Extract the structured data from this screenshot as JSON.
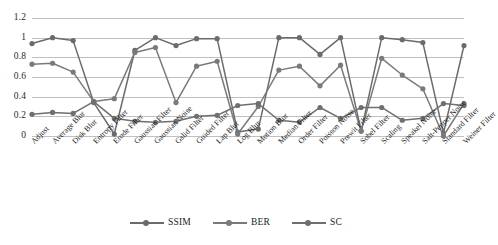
{
  "chart_data": {
    "type": "line",
    "title": "",
    "subtitle": "",
    "xlabel": "",
    "ylabel": "",
    "ylim": [
      0,
      1.2
    ],
    "yticks": [
      "0",
      "0.2",
      "0.4",
      "0.6",
      "0.8",
      "1",
      "1.2"
    ],
    "ytick_values": [
      0,
      0.2,
      0.4,
      0.6,
      0.8,
      1,
      1.2
    ],
    "grid": true,
    "legend_position": "bottom",
    "categories": [
      "Adjust",
      "Average Blur",
      "Disk Blur",
      "Entropy Filter",
      "Erode Filter",
      "Gaussian Filter",
      "Gaussian Noise",
      "Gslid Filter",
      "Guided Filter",
      "Lap Blur",
      "Log Blur",
      "Motion Blur",
      "Median Filter",
      "Order Filter",
      "Poisson Noise",
      "Prewit Filter",
      "Sobel Filter",
      "Scaling",
      "Speakel Noise",
      "Salt-Pepper Noise",
      "Standard Filter",
      "Weiner Filter"
    ],
    "series": [
      {
        "name": "SSIM",
        "color": "#6b6b6b",
        "values": [
          0.94,
          1.0,
          0.97,
          0.34,
          0.02,
          0.87,
          1.0,
          0.92,
          0.99,
          0.99,
          0.04,
          0.07,
          1.0,
          1.0,
          0.83,
          1.0,
          0.05,
          1.0,
          0.98,
          0.95,
          0.03,
          0.92
        ]
      },
      {
        "name": "BER",
        "color": "#7a7a7a",
        "values": [
          0.73,
          0.74,
          0.65,
          0.35,
          0.38,
          0.85,
          0.9,
          0.34,
          0.71,
          0.76,
          0.02,
          0.3,
          0.67,
          0.71,
          0.51,
          0.72,
          0.05,
          0.79,
          0.62,
          0.48,
          0.0,
          0.33
        ]
      },
      {
        "name": "SC",
        "color": "#6f6f6f",
        "values": [
          0.22,
          0.24,
          0.23,
          0.35,
          0.18,
          0.15,
          0.14,
          0.15,
          0.2,
          0.21,
          0.31,
          0.33,
          0.16,
          0.14,
          0.29,
          0.18,
          0.29,
          0.29,
          0.16,
          0.18,
          0.33,
          0.31
        ]
      }
    ]
  },
  "legend": {
    "entries": [
      {
        "label": "SSIM"
      },
      {
        "label": "BER"
      },
      {
        "label": "SC"
      }
    ]
  }
}
